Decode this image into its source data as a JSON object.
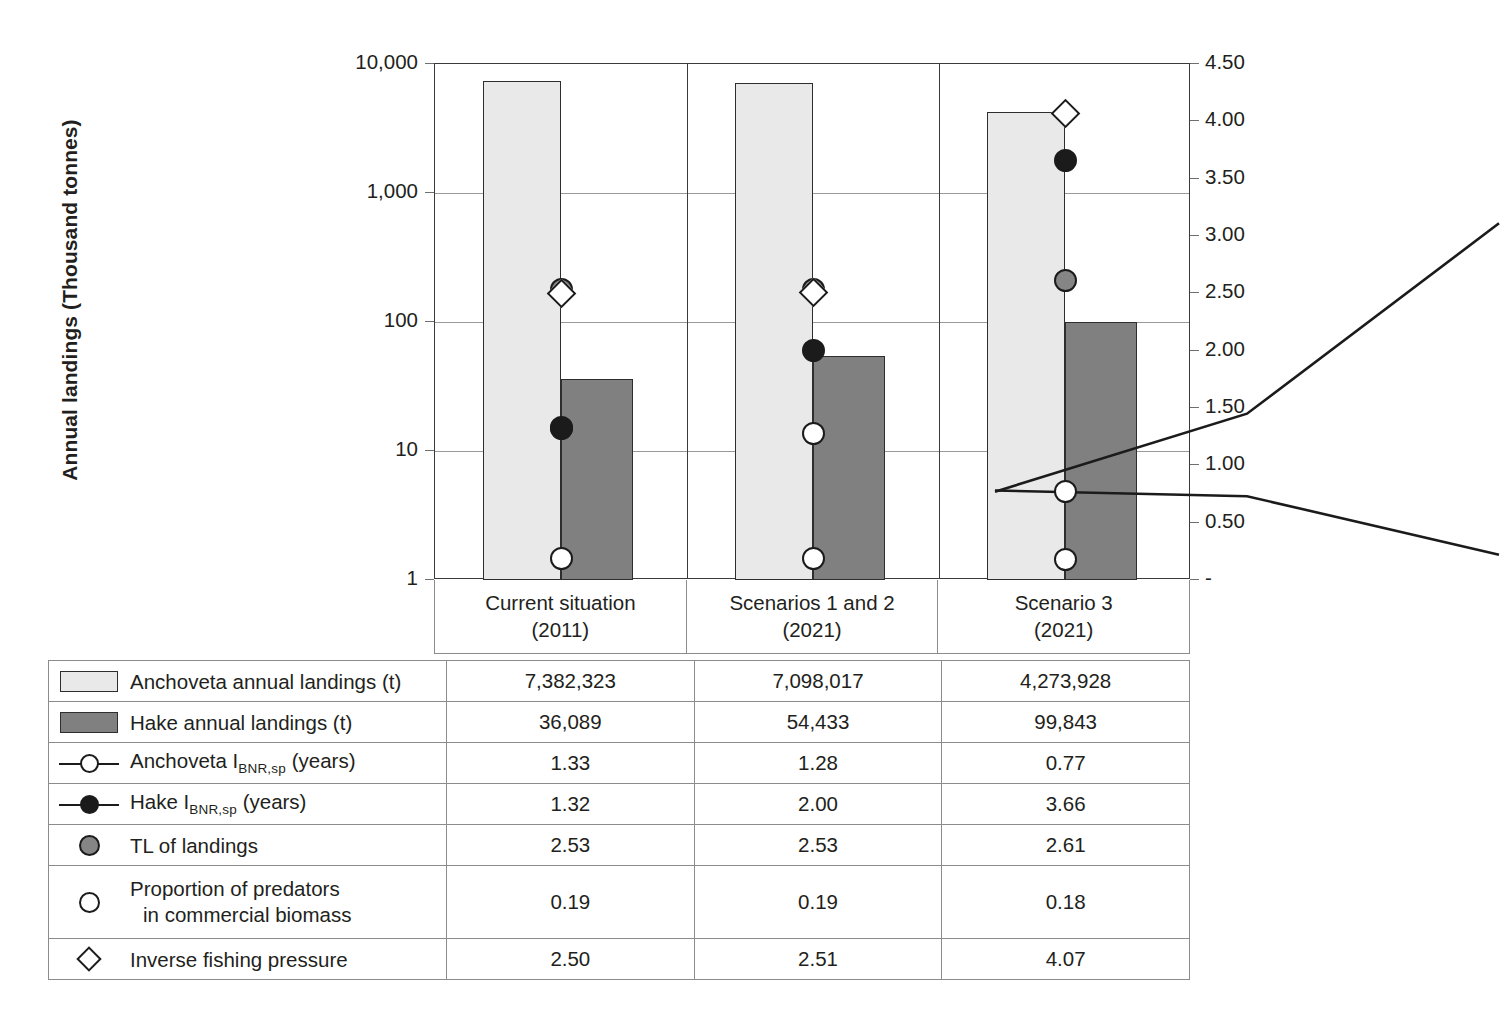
{
  "axis": {
    "y_left_title": "Annual landings (Thousand tonnes)",
    "y_left_ticks": [
      "10,000",
      "1,000",
      "100",
      "10",
      "1"
    ],
    "y_right_ticks": [
      "4.50",
      "4.00",
      "3.50",
      "3.00",
      "2.50",
      "2.00",
      "1.50",
      "1.00",
      "0.50",
      "-"
    ]
  },
  "categories": [
    {
      "line1": "Current situation",
      "line2": "(2011)"
    },
    {
      "line1": "Scenarios 1 and 2",
      "line2": "(2021)"
    },
    {
      "line1": "Scenario 3",
      "line2": "(2021)"
    }
  ],
  "legend_rows": [
    {
      "icon": "bar-swatch-light",
      "label_pre": "Anchoveta annual landings (t)",
      "label_sub": "",
      "label_post": "",
      "values": [
        "7,382,323",
        "7,098,017",
        "4,273,928"
      ]
    },
    {
      "icon": "bar-swatch-dark",
      "label_pre": "Hake annual landings (t)",
      "label_sub": "",
      "label_post": "",
      "values": [
        "36,089",
        "54,433",
        "99,843"
      ]
    },
    {
      "icon": "line-open-circle",
      "label_pre": "Anchoveta I",
      "label_sub": "BNR,sp",
      "label_post": " (years)",
      "values": [
        "1.33",
        "1.28",
        "0.77"
      ]
    },
    {
      "icon": "line-filled-circle",
      "label_pre": "Hake I",
      "label_sub": "BNR,sp",
      "label_post": " (years)",
      "values": [
        "1.32",
        "2.00",
        "3.66"
      ]
    },
    {
      "icon": "gray-circle",
      "label_pre": "TL of landings",
      "label_sub": "",
      "label_post": "",
      "values": [
        "2.53",
        "2.53",
        "2.61"
      ]
    },
    {
      "icon": "open-circle",
      "label_pre": "Proportion of predators",
      "label_sub": "",
      "label_post": "in commercial biomass",
      "values": [
        "0.19",
        "0.19",
        "0.18"
      ]
    },
    {
      "icon": "open-diamond",
      "label_pre": "Inverse fishing pressure",
      "label_sub": "",
      "label_post": "",
      "values": [
        "2.50",
        "2.51",
        "4.07"
      ]
    }
  ],
  "colors": {
    "anchoveta_bar": "#e9e9e9",
    "hake_bar": "#808080",
    "tl_marker": "#858585",
    "outline": "#1b1b1b",
    "gridline": "#9a9a9a"
  },
  "chart_data": {
    "type": "bar",
    "title": "",
    "xlabel": "",
    "ylabel": "Annual landings (Thousand tonnes)",
    "categories": [
      "Current situation (2011)",
      "Scenarios 1 and 2 (2021)",
      "Scenario 3 (2021)"
    ],
    "y_left_scale": "log",
    "ylim": [
      1,
      10000
    ],
    "y_left_ticks": [
      1,
      10,
      100,
      1000,
      10000
    ],
    "y_right_label": "",
    "y_right_lim": [
      0,
      4.5
    ],
    "y_right_ticks": [
      0,
      0.5,
      1.0,
      1.5,
      2.0,
      2.5,
      3.0,
      3.5,
      4.0,
      4.5
    ],
    "grid": true,
    "legend": "table-below",
    "series": [
      {
        "name": "Anchoveta annual landings (t)",
        "kind": "bar",
        "axis": "left",
        "unit": "thousand tonnes",
        "raw_values": [
          7382323,
          7098017,
          4273928
        ],
        "values": [
          7382.323,
          7098.017,
          4273.928
        ]
      },
      {
        "name": "Hake annual landings (t)",
        "kind": "bar",
        "axis": "left",
        "unit": "thousand tonnes",
        "raw_values": [
          36089,
          54433,
          99843
        ],
        "values": [
          36.089,
          54.433,
          99.843
        ]
      },
      {
        "name": "Anchoveta IBNR,sp (years)",
        "kind": "line-marker",
        "marker": "open-circle",
        "axis": "right",
        "values": [
          1.33,
          1.28,
          0.77
        ]
      },
      {
        "name": "Hake IBNR,sp (years)",
        "kind": "line-marker",
        "marker": "filled-circle",
        "axis": "right",
        "values": [
          1.32,
          2.0,
          3.66
        ]
      },
      {
        "name": "TL of landings",
        "kind": "marker",
        "marker": "gray-circle",
        "axis": "right",
        "values": [
          2.53,
          2.53,
          2.61
        ]
      },
      {
        "name": "Proportion of predators in commercial biomass",
        "kind": "marker",
        "marker": "open-circle",
        "axis": "right",
        "values": [
          0.19,
          0.19,
          0.18
        ]
      },
      {
        "name": "Inverse fishing pressure",
        "kind": "marker",
        "marker": "open-diamond",
        "axis": "right",
        "values": [
          2.5,
          2.51,
          4.07
        ]
      }
    ]
  }
}
